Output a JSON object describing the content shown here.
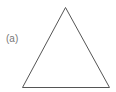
{
  "figure": {
    "label": "(a)",
    "shape": "triangle",
    "stroke_color": "#555555",
    "vertices": {
      "apex": [
        65.5,
        7.5
      ],
      "bottom_left": [
        22.5,
        87.5
      ],
      "bottom_right": [
        109.5,
        87.5
      ]
    }
  }
}
